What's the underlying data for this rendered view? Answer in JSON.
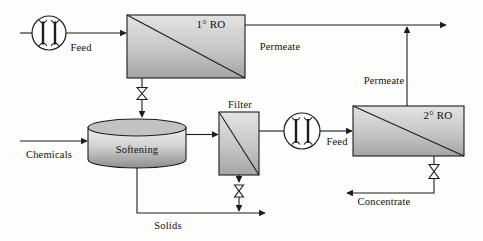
{
  "flow": {
    "labels": {
      "feed_1": "Feed",
      "ro_1": "1° RO",
      "permeate_1": "Permeate",
      "chemicals": "Chemicals",
      "softening": "Softening",
      "filter": "Filter",
      "feed_2": "Feed",
      "ro_2": "2° RO",
      "permeate_2": "Permeate",
      "concentrate": "Concentrate",
      "solids": "Solids"
    },
    "icons": {
      "pump_1": "pump-icon",
      "pump_2": "pump-icon",
      "valve_ro1_drain": "valve-icon",
      "valve_filter_drain": "valve-icon",
      "valve_ro2_concentrate": "valve-icon"
    },
    "colors": {
      "line": "#1c1c1c",
      "unit_fill_light": "#e3e3e3",
      "unit_fill_dark": "#a4a4a4",
      "tank_fill_light": "#f1f1f1",
      "tank_fill_dark": "#8f8f8f",
      "background": "#fdfdfc"
    }
  }
}
